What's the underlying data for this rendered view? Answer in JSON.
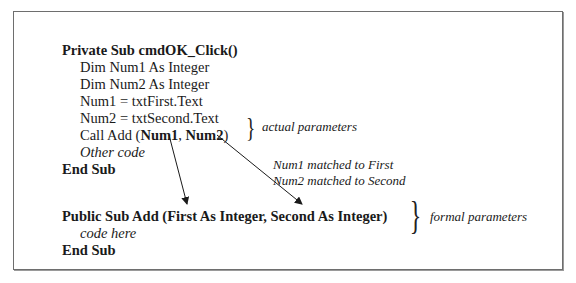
{
  "caller": {
    "header": "Private Sub cmdOK_Click()",
    "lines": [
      "Dim Num1 As Integer",
      "Dim Num2 As Integer",
      "Num1 = txtFirst.Text",
      "Num2 = txtSecond.Text"
    ],
    "call_prefix": "Call Add (",
    "arg1": "Num1",
    "sep": ", ",
    "arg2": "Num2",
    "call_suffix": ")",
    "other_code": "Other code",
    "end": "End Sub"
  },
  "callee": {
    "header": "Public Sub Add (First As Integer, Second As Integer)",
    "body": "code here",
    "end": "End Sub"
  },
  "annotations": {
    "actual": "actual parameters",
    "formal": "formal parameters",
    "match1": "Num1 matched to First",
    "match2": "Num2 matched to Second"
  },
  "arrows": [
    {
      "from": "Num1",
      "to": "First"
    },
    {
      "from": "Num2",
      "to": "Second"
    }
  ]
}
